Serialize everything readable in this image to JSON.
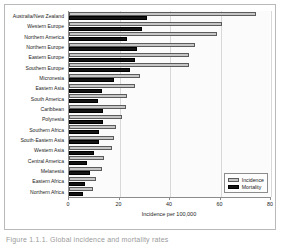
{
  "chart_data": {
    "type": "bar",
    "orientation": "horizontal",
    "title": "",
    "xlabel": "Incidence per 100,000",
    "ylabel": "",
    "xlim": [
      0,
      80
    ],
    "xticks": [
      0,
      20,
      40,
      60,
      80
    ],
    "grid": true,
    "legend_position": "bottom-right",
    "categories": [
      "Australia/New Zealand",
      "Western Europe",
      "Northern America",
      "Northern Europe",
      "Eastern Europe",
      "Southern Europe",
      "Micronesia",
      "Eastern Asia",
      "South America",
      "Caribbean",
      "Polynesia",
      "Southern Africa",
      "South-Eastern Asia",
      "Western Asia",
      "Central America",
      "Melanesia",
      "Eastern Africa",
      "Northern Africa"
    ],
    "series": [
      {
        "name": "Incidence",
        "color": "#c6c6c6",
        "values": [
          74.0,
          60.5,
          58.5,
          50.0,
          47.5,
          47.5,
          28.0,
          26.0,
          23.0,
          22.5,
          21.0,
          18.5,
          18.0,
          17.0,
          14.0,
          13.0,
          10.5,
          9.5
        ]
      },
      {
        "name": "Mortality",
        "color": "#141414",
        "values": [
          31.0,
          29.0,
          23.0,
          27.0,
          26.0,
          24.0,
          18.0,
          13.0,
          11.5,
          13.5,
          13.5,
          12.0,
          12.0,
          10.0,
          7.0,
          8.5,
          6.5,
          5.5
        ]
      }
    ]
  },
  "legend": {
    "items": [
      {
        "label": "Incidence"
      },
      {
        "label": "Mortality"
      }
    ]
  },
  "caption": {
    "text": "Figure 1.1.1. Global incidence and mortality rates"
  }
}
